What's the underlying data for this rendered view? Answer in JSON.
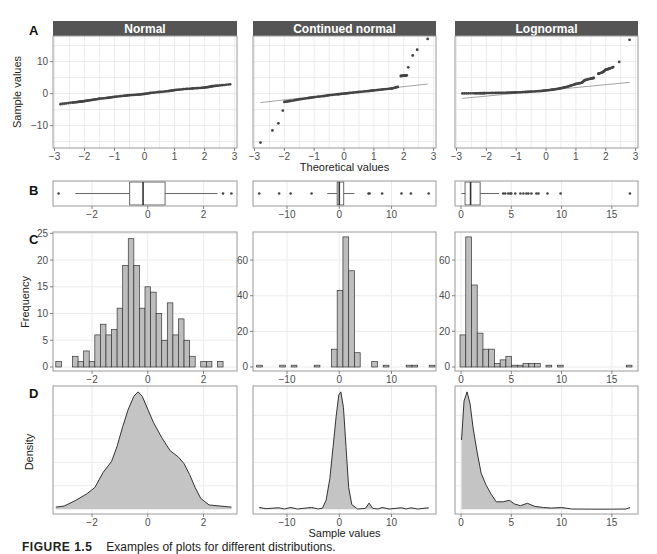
{
  "figure": {
    "caption_label": "FIGURE 1.5",
    "caption_text": "Examples of plots for different distributions.",
    "row_labels": [
      "A",
      "B",
      "C",
      "D"
    ],
    "colors": {
      "strip_bg": "#555555",
      "strip_text": "#ffffff",
      "panel_border": "#9a9a9a",
      "grid": "#ebebeb",
      "point": "#444444",
      "ref_line": "#9a9a9a",
      "bar_fill": "#bdbdbd",
      "bar_stroke": "#333333",
      "density_fill": "#c4c4c4",
      "density_stroke": "#333333",
      "tick_text": "#4d4d4d"
    }
  },
  "chart_data": [
    {
      "id": "qq",
      "type": "scatter",
      "row": "A",
      "title": "Q-Q plots",
      "xlabel": "Theoretical values",
      "ylabel": "Sample values",
      "xlim": [
        -3,
        3
      ],
      "ylim": [
        -17,
        18
      ],
      "xticks": [
        -3,
        -2,
        -1,
        0,
        1,
        2,
        3
      ],
      "yticks": [
        -10,
        0,
        10
      ],
      "panels": [
        {
          "strip": "Normal",
          "ref_line": [
            [
              -2.8,
              -3.0
            ],
            [
              2.8,
              2.8
            ]
          ],
          "points": [
            [
              -2.8,
              -3.3
            ],
            [
              -2.4,
              -2.8
            ],
            [
              -2.2,
              -2.6
            ],
            [
              -2.05,
              -2.4
            ],
            [
              -1.9,
              -2.2
            ],
            [
              -1.7,
              -1.9
            ],
            [
              -1.5,
              -1.6
            ],
            [
              -1.2,
              -1.3
            ],
            [
              -1.0,
              -1.0
            ],
            [
              -0.7,
              -0.7
            ],
            [
              -0.5,
              -0.5
            ],
            [
              -0.2,
              -0.3
            ],
            [
              0.0,
              -0.1
            ],
            [
              0.2,
              0.2
            ],
            [
              0.5,
              0.5
            ],
            [
              0.8,
              0.8
            ],
            [
              1.0,
              1.1
            ],
            [
              1.3,
              1.4
            ],
            [
              1.6,
              1.6
            ],
            [
              1.9,
              1.8
            ],
            [
              2.1,
              2.0
            ],
            [
              2.25,
              2.3
            ],
            [
              2.45,
              2.5
            ],
            [
              2.85,
              2.9
            ]
          ]
        },
        {
          "strip": "Continued normal",
          "ref_line": [
            [
              -2.8,
              -2.8
            ],
            [
              2.8,
              3.0
            ]
          ],
          "points": [
            [
              -2.8,
              -15.3
            ],
            [
              -2.4,
              -11.5
            ],
            [
              -2.2,
              -9.3
            ],
            [
              -2.05,
              -5.3
            ],
            [
              -2.0,
              -2.6
            ],
            [
              -1.8,
              -2.3
            ],
            [
              -1.5,
              -1.8
            ],
            [
              -1.2,
              -1.4
            ],
            [
              -1.0,
              -1.1
            ],
            [
              -0.7,
              -0.8
            ],
            [
              -0.5,
              -0.5
            ],
            [
              -0.2,
              -0.2
            ],
            [
              0.0,
              0.0
            ],
            [
              0.2,
              0.2
            ],
            [
              0.5,
              0.5
            ],
            [
              0.8,
              0.8
            ],
            [
              1.0,
              1.0
            ],
            [
              1.3,
              1.3
            ],
            [
              1.6,
              1.6
            ],
            [
              1.8,
              2.1
            ],
            [
              1.9,
              5.5
            ],
            [
              2.0,
              5.6
            ],
            [
              2.1,
              5.7
            ],
            [
              2.15,
              8.2
            ],
            [
              2.3,
              11.9
            ],
            [
              2.45,
              13.7
            ],
            [
              2.8,
              17.1
            ]
          ]
        },
        {
          "strip": "Lognormal",
          "ref_line": [
            [
              -2.8,
              -1.5
            ],
            [
              2.8,
              3.5
            ]
          ],
          "points": [
            [
              -2.8,
              0.05
            ],
            [
              -2.4,
              0.1
            ],
            [
              -2.2,
              0.12
            ],
            [
              -2.05,
              0.15
            ],
            [
              -1.8,
              0.2
            ],
            [
              -1.5,
              0.25
            ],
            [
              -1.2,
              0.32
            ],
            [
              -1.0,
              0.38
            ],
            [
              -0.7,
              0.5
            ],
            [
              -0.5,
              0.6
            ],
            [
              -0.2,
              0.8
            ],
            [
              0.0,
              1.0
            ],
            [
              0.2,
              1.2
            ],
            [
              0.4,
              1.5
            ],
            [
              0.6,
              1.9
            ],
            [
              0.8,
              2.4
            ],
            [
              1.0,
              3.0
            ],
            [
              1.2,
              3.4
            ],
            [
              1.3,
              4.2
            ],
            [
              1.5,
              4.7
            ],
            [
              1.6,
              4.9
            ],
            [
              1.75,
              6.2
            ],
            [
              1.9,
              6.7
            ],
            [
              2.0,
              7.5
            ],
            [
              2.1,
              7.7
            ],
            [
              2.25,
              8.3
            ],
            [
              2.45,
              9.9
            ],
            [
              2.8,
              16.8
            ]
          ]
        }
      ]
    },
    {
      "id": "box",
      "type": "box",
      "row": "B",
      "panels": [
        {
          "xlim": [
            -3.4,
            3.2
          ],
          "xticks": [
            -2,
            0,
            2
          ],
          "q1": -0.65,
          "median": -0.17,
          "q3": 0.62,
          "whisker_lo": -2.6,
          "whisker_hi": 2.5,
          "outliers": [
            -3.2,
            2.7,
            3.0
          ]
        },
        {
          "xlim": [
            -16.5,
            18.5
          ],
          "xticks": [
            -10,
            0,
            10
          ],
          "q1": -0.4,
          "median": 0.0,
          "q3": 0.85,
          "whisker_lo": -2.3,
          "whisker_hi": 2.9,
          "outliers": [
            -15.3,
            -11.5,
            -9.3,
            -5.3,
            5.6,
            5.8,
            8.2,
            11.9,
            13.7,
            17.1
          ]
        },
        {
          "xlim": [
            -0.6,
            17.6
          ],
          "xticks": [
            0,
            5,
            10,
            15
          ],
          "q1": 0.4,
          "median": 0.95,
          "q3": 1.9,
          "whisker_lo": 0.05,
          "whisker_hi": 3.8,
          "outliers": [
            4.2,
            4.4,
            4.7,
            4.9,
            5.0,
            5.4,
            5.9,
            6.2,
            6.5,
            6.7,
            7.0,
            7.5,
            7.7,
            8.6,
            9.9,
            16.8
          ]
        }
      ]
    },
    {
      "id": "hist",
      "type": "bar",
      "row": "C",
      "ylabel": "Frequency",
      "panels": [
        {
          "xlim": [
            -3.4,
            3.2
          ],
          "xticks": [
            -2,
            0,
            2
          ],
          "ylim": [
            0,
            25
          ],
          "yticks": [
            0,
            5,
            10,
            15,
            20,
            25
          ],
          "bin_start": -3.3,
          "bin_width": 0.2,
          "counts": [
            1,
            0,
            0,
            2,
            1,
            3,
            1,
            6,
            8,
            6,
            7,
            11,
            19,
            24,
            19,
            11,
            15,
            14,
            10,
            5,
            12,
            6,
            9,
            5,
            2,
            0,
            1,
            1,
            0,
            1
          ]
        },
        {
          "xlim": [
            -16.5,
            18.5
          ],
          "xticks": [
            -10,
            0,
            10
          ],
          "ylim": [
            0,
            75
          ],
          "yticks": [
            0,
            20,
            40,
            60
          ],
          "bin_start": -15.8,
          "bin_width": 1.1,
          "counts": [
            1,
            0,
            0,
            0,
            1,
            0,
            1,
            0,
            0,
            0,
            1,
            0,
            0,
            10,
            43,
            73,
            54,
            8,
            0,
            0,
            3,
            0,
            1,
            0,
            0,
            0,
            1,
            1,
            0,
            0,
            1
          ]
        },
        {
          "xlim": [
            -0.6,
            17.6
          ],
          "xticks": [
            0,
            5,
            10,
            15
          ],
          "ylim": [
            0,
            75
          ],
          "yticks": [
            0,
            20,
            40,
            60
          ],
          "bin_start": -0.1,
          "bin_width": 0.57,
          "counts": [
            18,
            73,
            46,
            19,
            10,
            10,
            2,
            4,
            6,
            1,
            1,
            2,
            2,
            2,
            0,
            1,
            0,
            1,
            0,
            0,
            0,
            0,
            0,
            0,
            0,
            0,
            0,
            0,
            0,
            1
          ]
        }
      ]
    },
    {
      "id": "density",
      "type": "area",
      "row": "D",
      "ylabel": "Density",
      "xlabel": "Sample values",
      "panels": [
        {
          "xlim": [
            -3.4,
            3.2
          ],
          "xticks": [
            -2,
            0,
            2
          ],
          "curve": [
            [
              -3.3,
              0.01
            ],
            [
              -3.0,
              0.015
            ],
            [
              -2.6,
              0.04
            ],
            [
              -2.2,
              0.07
            ],
            [
              -1.9,
              0.1
            ],
            [
              -1.6,
              0.17
            ],
            [
              -1.3,
              0.22
            ],
            [
              -1.1,
              0.29
            ],
            [
              -0.9,
              0.38
            ],
            [
              -0.7,
              0.46
            ],
            [
              -0.5,
              0.52
            ],
            [
              -0.35,
              0.54
            ],
            [
              -0.2,
              0.52
            ],
            [
              0.0,
              0.46
            ],
            [
              0.2,
              0.4
            ],
            [
              0.5,
              0.33
            ],
            [
              0.8,
              0.27
            ],
            [
              1.1,
              0.24
            ],
            [
              1.3,
              0.21
            ],
            [
              1.5,
              0.16
            ],
            [
              1.7,
              0.1
            ],
            [
              1.9,
              0.05
            ],
            [
              2.2,
              0.02
            ],
            [
              2.6,
              0.015
            ],
            [
              3.0,
              0.01
            ]
          ]
        },
        {
          "xlim": [
            -16.5,
            18.5
          ],
          "xticks": [
            -10,
            0,
            10
          ],
          "curve": [
            [
              -15.3,
              0.006
            ],
            [
              -14,
              0.002
            ],
            [
              -11.6,
              0.005
            ],
            [
              -10.5,
              0.001
            ],
            [
              -9.3,
              0.006
            ],
            [
              -8,
              0.001
            ],
            [
              -5.3,
              0.006
            ],
            [
              -4,
              0.001
            ],
            [
              -3.2,
              0.004
            ],
            [
              -2.5,
              0.03
            ],
            [
              -1.8,
              0.1
            ],
            [
              -1.2,
              0.2
            ],
            [
              -0.6,
              0.3
            ],
            [
              -0.1,
              0.37
            ],
            [
              0.3,
              0.38
            ],
            [
              0.8,
              0.33
            ],
            [
              1.3,
              0.2
            ],
            [
              1.8,
              0.07
            ],
            [
              2.4,
              0.015
            ],
            [
              3.5,
              0.001
            ],
            [
              5.0,
              0.003
            ],
            [
              5.7,
              0.02
            ],
            [
              6.4,
              0.003
            ],
            [
              7.4,
              0.001
            ],
            [
              8.2,
              0.006
            ],
            [
              9.5,
              0.001
            ],
            [
              11.9,
              0.005
            ],
            [
              12.8,
              0.001
            ],
            [
              13.7,
              0.005
            ],
            [
              15,
              0.001
            ],
            [
              17.1,
              0.005
            ]
          ]
        },
        {
          "xlim": [
            -0.6,
            17.6
          ],
          "xticks": [
            0,
            5,
            10,
            15
          ],
          "curve": [
            [
              0.05,
              0.23
            ],
            [
              0.3,
              0.36
            ],
            [
              0.6,
              0.39
            ],
            [
              0.9,
              0.35
            ],
            [
              1.2,
              0.27
            ],
            [
              1.6,
              0.19
            ],
            [
              2.0,
              0.12
            ],
            [
              2.5,
              0.08
            ],
            [
              3.0,
              0.05
            ],
            [
              3.5,
              0.025
            ],
            [
              4.2,
              0.025
            ],
            [
              4.8,
              0.03
            ],
            [
              5.3,
              0.018
            ],
            [
              5.9,
              0.012
            ],
            [
              6.6,
              0.02
            ],
            [
              7.3,
              0.01
            ],
            [
              8.2,
              0.006
            ],
            [
              9.0,
              0.004
            ],
            [
              10.0,
              0.006
            ],
            [
              11,
              0.001
            ],
            [
              13,
              0.0005
            ],
            [
              15,
              0.0005
            ],
            [
              16.4,
              0.001
            ],
            [
              16.8,
              0.006
            ]
          ]
        }
      ]
    }
  ]
}
